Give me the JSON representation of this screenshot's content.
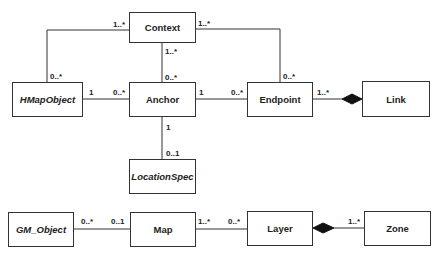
{
  "diagram": {
    "type": "UML class diagram",
    "classes": [
      {
        "id": "context",
        "label": "Context",
        "abstract": false
      },
      {
        "id": "hmapobject",
        "label": "HMapObject",
        "abstract": true
      },
      {
        "id": "anchor",
        "label": "Anchor",
        "abstract": false
      },
      {
        "id": "endpoint",
        "label": "Endpoint",
        "abstract": false
      },
      {
        "id": "link",
        "label": "Link",
        "abstract": false
      },
      {
        "id": "locationspec",
        "label": "LocationSpec",
        "abstract": true
      },
      {
        "id": "gm_object",
        "label": "GM_Object",
        "abstract": true
      },
      {
        "id": "map",
        "label": "Map",
        "abstract": false
      },
      {
        "id": "layer",
        "label": "Layer",
        "abstract": false
      },
      {
        "id": "zone",
        "label": "Zone",
        "abstract": false
      }
    ],
    "associations": [
      {
        "from": "Context",
        "to": "HMapObject",
        "from_mult": "1..*",
        "to_mult": "0..*",
        "kind": "association"
      },
      {
        "from": "Context",
        "to": "Anchor",
        "from_mult": "1..*",
        "to_mult": "0..*",
        "kind": "association"
      },
      {
        "from": "Context",
        "to": "Endpoint",
        "from_mult": "1..*",
        "to_mult": "0..*",
        "kind": "association"
      },
      {
        "from": "HMapObject",
        "to": "Anchor",
        "from_mult": "1",
        "to_mult": "0..*",
        "kind": "association"
      },
      {
        "from": "Anchor",
        "to": "Endpoint",
        "from_mult": "1",
        "to_mult": "0..*",
        "kind": "association"
      },
      {
        "from": "Link",
        "to": "Endpoint",
        "from_mult": "",
        "to_mult": "1..*",
        "kind": "composition"
      },
      {
        "from": "Anchor",
        "to": "LocationSpec",
        "from_mult": "1",
        "to_mult": "0..1",
        "kind": "association"
      },
      {
        "from": "GM_Object",
        "to": "Map",
        "from_mult": "0..*",
        "to_mult": "0..1",
        "kind": "association"
      },
      {
        "from": "Map",
        "to": "Layer",
        "from_mult": "1..*",
        "to_mult": "0..*",
        "kind": "association"
      },
      {
        "from": "Layer",
        "to": "Zone",
        "from_mult": "",
        "to_mult": "1..*",
        "kind": "composition"
      }
    ],
    "multiplicities": {
      "ctx_hmap_ctx": "1..*",
      "ctx_hmap_hmap": "0..*",
      "ctx_endp_ctx": "1..*",
      "ctx_endp_endp": "0..*",
      "ctx_anchor_ctx": "1..*",
      "ctx_anchor_anchor": "0..*",
      "hmap_anchor_hmap": "1",
      "hmap_anchor_anchor": "0..*",
      "anchor_endp_anchor": "1",
      "anchor_endp_endp": "0..*",
      "endp_link_endp": "1..*",
      "anchor_loc_anchor": "1",
      "anchor_loc_loc": "0..1",
      "gm_map_gm": "0..*",
      "gm_map_map": "0..1",
      "map_layer_map": "1..*",
      "map_layer_layer": "0..*",
      "layer_zone_zone": "1..*"
    },
    "colors": {
      "line": "#333333",
      "fill": "#ffffff",
      "text": "#222222"
    }
  }
}
